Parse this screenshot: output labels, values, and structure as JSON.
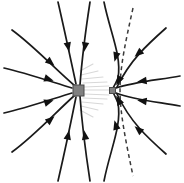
{
  "figure": {
    "type": "field-line-diagram",
    "width": 184,
    "height": 183,
    "background_color": "#ffffff"
  },
  "style": {
    "fieldline_color": "#1a1a1a",
    "fieldline_width": 1.7,
    "faint_fieldline_color": "#d8d8d8",
    "separatrix_color": "#3a3a3a",
    "separatrix_dasharray": "4 3.4",
    "arrow_color": "#111111",
    "charge_stroke_color": "#4a4a4a"
  },
  "charges": [
    {
      "name": "large-charge",
      "shape": "square",
      "cx": 78.5,
      "cy": 90.5,
      "size": 11,
      "color": "#808080",
      "relative_magnitude": "large"
    },
    {
      "name": "small-charge",
      "shape": "square",
      "cx": 112.5,
      "cy": 90.5,
      "size": 6,
      "color": "#808080",
      "relative_magnitude": "small"
    }
  ],
  "field_lines": [
    {
      "name": "line-left-upper-far",
      "d": "M 12 30 C 34 46, 56 70, 75 86"
    },
    {
      "name": "line-left-horizontal-upper",
      "d": "M 4 68 C 26 73, 52 82, 72 88"
    },
    {
      "name": "line-left-horizontal-lower",
      "d": "M 4 113 C 26 108, 52 99, 72 93"
    },
    {
      "name": "line-left-lower-far",
      "d": "M 12 152 C 34 136, 56 112, 75 95"
    },
    {
      "name": "line-top-left-steep",
      "d": "M 58 2 C 64 28, 70 56, 76 84"
    },
    {
      "name": "line-top-center",
      "d": "M 90 2 C 86 28, 82 58, 80 85"
    },
    {
      "name": "line-bottom-left-steep",
      "d": "M 58 181 C 64 155, 70 127, 76 97"
    },
    {
      "name": "line-bottom-center",
      "d": "M 90 181 C 86 155, 82 125, 80 96"
    },
    {
      "name": "line-upper-right-outer",
      "d": "M 166 28 C 148 44, 130 60, 117 87"
    },
    {
      "name": "line-lower-right-outer",
      "d": "M 166 154 C 148 138, 130 122, 117 94"
    },
    {
      "name": "line-right-upper-mid",
      "d": "M 180 76 C 158 80, 134 82, 116 88"
    },
    {
      "name": "line-right-lower-mid",
      "d": "M 180 106 C 158 102, 134 100, 116 93"
    },
    {
      "name": "line-saddle-upper",
      "d": "M 104 2 C 110 32, 122 56, 118 78 C 115 85, 113 88, 112 90"
    },
    {
      "name": "line-saddle-lower",
      "d": "M 104 181 C 110 150, 122 126, 118 103 C 115 96, 113 92, 112 91"
    }
  ],
  "faint_field_lines": [
    {
      "name": "faint-line-1",
      "d": "M 84 90 L 109 90"
    },
    {
      "name": "faint-line-2",
      "d": "M 84 87 L 109 86"
    },
    {
      "name": "faint-line-3",
      "d": "M 84 94 L 109 95"
    },
    {
      "name": "faint-line-4",
      "d": "M 83 83 L 107 82"
    },
    {
      "name": "faint-line-5",
      "d": "M 83 98 L 107 99"
    },
    {
      "name": "faint-line-6",
      "d": "M 82 79 L 103 77"
    },
    {
      "name": "faint-line-7",
      "d": "M 82 102 L 103 104"
    },
    {
      "name": "faint-line-8",
      "d": "M 81 75 L 98 71"
    },
    {
      "name": "faint-line-9",
      "d": "M 81 106 L 98 110"
    },
    {
      "name": "faint-line-10",
      "d": "M 80 71 L 93 64"
    },
    {
      "name": "faint-line-11",
      "d": "M 80 110 L 93 117"
    }
  ],
  "separatrix": {
    "name": "separatrix-dashed-curve",
    "description": "dashed neutral-point separatrix passing right of the small charge",
    "d": "M 133 8 C 126 40, 120 66, 120 90 C 120 114, 126 142, 133 176"
  },
  "arrows": [
    {
      "name": "arrow-left-upper-far",
      "x": 50,
      "y": 62,
      "angle": 40
    },
    {
      "name": "arrow-left-horizontal-upper",
      "x": 48,
      "y": 79,
      "angle": 18
    },
    {
      "name": "arrow-left-horizontal-lower",
      "x": 48,
      "y": 102,
      "angle": -18
    },
    {
      "name": "arrow-left-lower-far",
      "x": 50,
      "y": 120,
      "angle": -40
    },
    {
      "name": "arrow-top-left-steep",
      "x": 68,
      "y": 46,
      "angle": 78
    },
    {
      "name": "arrow-top-center",
      "x": 85,
      "y": 46,
      "angle": 99
    },
    {
      "name": "arrow-bottom-left-steep",
      "x": 68,
      "y": 136,
      "angle": -78
    },
    {
      "name": "arrow-bottom-center",
      "x": 85,
      "y": 136,
      "angle": -99
    },
    {
      "name": "arrow-upper-right-outer",
      "x": 139,
      "y": 53,
      "angle": 139
    },
    {
      "name": "arrow-lower-right-outer",
      "x": 139,
      "y": 130,
      "angle": -139
    },
    {
      "name": "arrow-right-upper-mid",
      "x": 143,
      "y": 81,
      "angle": 172
    },
    {
      "name": "arrow-right-lower-mid",
      "x": 143,
      "y": 101,
      "angle": -172
    },
    {
      "name": "arrow-saddle-upper",
      "x": 116,
      "y": 56,
      "angle": 105
    },
    {
      "name": "arrow-saddle-lower",
      "x": 116,
      "y": 126,
      "angle": -105
    },
    {
      "name": "arrow-saddle-upper-inner",
      "x": 119,
      "y": 80,
      "angle": 118
    },
    {
      "name": "arrow-saddle-lower-inner",
      "x": 119,
      "y": 101,
      "angle": -118
    }
  ]
}
